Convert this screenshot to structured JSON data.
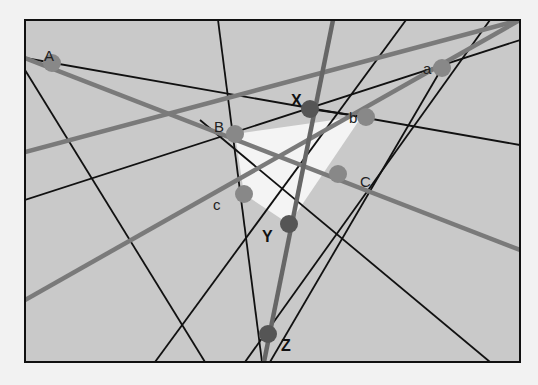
{
  "diagram": {
    "type": "projective-geometry-construction",
    "colors": {
      "background": "#f2f2f2",
      "frame_fill": "#c9c9c9",
      "frame_border": "#111111",
      "triangle_fill": "#f4f4f4",
      "thin_line": "#111111",
      "thick_line": "#7a7a7a",
      "axis_line": "#666666",
      "light_point": "#888888",
      "dark_point": "#555555"
    },
    "frame": {
      "x": 25,
      "y": 20,
      "w": 495,
      "h": 342
    },
    "points": [
      {
        "id": "A",
        "label": "A",
        "x": 52,
        "y": 63,
        "lx": 44,
        "ly": 50,
        "style": "light"
      },
      {
        "id": "a",
        "label": "a",
        "x": 442,
        "y": 68,
        "lx": 423,
        "ly": 63,
        "style": "light"
      },
      {
        "id": "B",
        "label": "B",
        "x": 235,
        "y": 134,
        "lx": 214,
        "ly": 121,
        "style": "light"
      },
      {
        "id": "b",
        "label": "b",
        "x": 366,
        "y": 117,
        "lx": 349,
        "ly": 112,
        "style": "light"
      },
      {
        "id": "C",
        "label": "C",
        "x": 338,
        "y": 174,
        "lx": 360,
        "ly": 176,
        "style": "light"
      },
      {
        "id": "c",
        "label": "c",
        "x": 244,
        "y": 194,
        "lx": 213,
        "ly": 199,
        "style": "light"
      },
      {
        "id": "X",
        "label": "X",
        "x": 310,
        "y": 109,
        "lx": 291,
        "ly": 95,
        "style": "dark"
      },
      {
        "id": "Y",
        "label": "Y",
        "x": 289,
        "y": 224,
        "lx": 262,
        "ly": 231,
        "style": "dark"
      },
      {
        "id": "Z",
        "label": "Z",
        "x": 268,
        "y": 334,
        "lx": 281,
        "ly": 340,
        "style": "dark"
      }
    ],
    "triangle": [
      [
        235,
        134
      ],
      [
        362,
        116
      ],
      [
        289,
        224
      ],
      [
        244,
        194
      ]
    ],
    "thin_lines": [
      [
        [
          25,
          58
        ],
        [
          520,
          145
        ]
      ],
      [
        [
          25,
          70
        ],
        [
          205,
          362
        ]
      ],
      [
        [
          25,
          200
        ],
        [
          520,
          40
        ]
      ],
      [
        [
          218,
          20
        ],
        [
          262,
          362
        ]
      ],
      [
        [
          155,
          362
        ],
        [
          406,
          20
        ]
      ],
      [
        [
          245,
          362
        ],
        [
          490,
          20
        ]
      ],
      [
        [
          270,
          362
        ],
        [
          442,
          68
        ]
      ],
      [
        [
          200,
          120
        ],
        [
          490,
          362
        ]
      ],
      [
        [
          310,
          109
        ],
        [
          366,
          117
        ]
      ]
    ],
    "thick_lines": [
      [
        [
          25,
          152
        ],
        [
          520,
          20
        ]
      ],
      [
        [
          25,
          58
        ],
        [
          520,
          250
        ]
      ],
      [
        [
          25,
          300
        ],
        [
          520,
          20
        ]
      ]
    ],
    "axis_line": [
      [
        333,
        20
      ],
      [
        264,
        362
      ]
    ]
  }
}
